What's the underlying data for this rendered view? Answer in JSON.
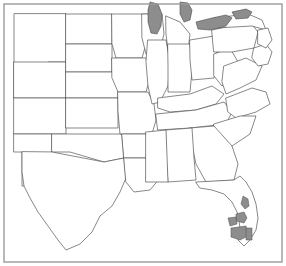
{
  "figure": {
    "width": 286,
    "height": 266,
    "background_color": "#ffffff",
    "frame": {
      "name": "map-border-frame",
      "color": "#9a9a9a",
      "style": "thin rectangular border",
      "x": 4,
      "y": 4,
      "width": 278,
      "height": 258
    }
  },
  "chart_data": {
    "type": "map",
    "title": "",
    "subtitle": "",
    "projection": "plate-carree-like",
    "region": "Central and Eastern United States",
    "line_color": "#555555",
    "fill_color": "#ffffff",
    "highlight_color": "#8d8d8d",
    "legend": null,
    "annotations": [],
    "visible_features": [
      "state boundary outlines",
      "national coastline",
      "shaded Great Lakes",
      "shaded counties in south Florida"
    ],
    "shaded_areas": [
      {
        "name": "Lake Michigan",
        "type": "lake",
        "color": "#8d8d8d"
      },
      {
        "name": "Lake Huron",
        "type": "lake",
        "color": "#8d8d8d"
      },
      {
        "name": "Lake Erie",
        "type": "lake",
        "color": "#8d8d8d"
      },
      {
        "name": "Lake Ontario",
        "type": "lake",
        "color": "#8d8d8d"
      },
      {
        "name": "South Florida counties",
        "type": "highlighted-region",
        "color": "#8d8d8d"
      }
    ],
    "states_depicted": [
      "Montana",
      "North Dakota",
      "South Dakota",
      "Wyoming",
      "Nebraska",
      "Colorado",
      "Kansas",
      "New Mexico",
      "Oklahoma",
      "Texas",
      "Minnesota",
      "Iowa",
      "Missouri",
      "Arkansas",
      "Louisiana",
      "Wisconsin",
      "Illinois",
      "Mississippi",
      "Alabama",
      "Tennessee",
      "Kentucky",
      "Indiana",
      "Michigan",
      "Ohio",
      "West Virginia",
      "Virginia",
      "North Carolina",
      "South Carolina",
      "Georgia",
      "Florida",
      "Pennsylvania",
      "Maryland",
      "Delaware",
      "New Jersey",
      "New York"
    ]
  },
  "map_geometry": {
    "outer_coastline": "M 30 14 L 256 14 L 258 24 L 268 36 L 272 48 L 268 58 L 270 70 L 262 84 L 252 96 L 248 110 L 240 124 L 232 140 L 225 152 L 215 162 L 200 168 L 185 172 L 170 175 L 155 178 L 140 180",
    "states": [
      {
        "id": "montana-wyoming-block",
        "name": "Montana / Wyoming",
        "d": "M 14 14 L 14 98 L 48 98 L 48 62 L 66 62 L 66 14 Z"
      },
      {
        "id": "wyoming",
        "name": "Wyoming",
        "d": "M 14 62 L 66 62 L 66 98 L 14 98 Z"
      },
      {
        "id": "colorado",
        "name": "Colorado",
        "d": "M 14 98 L 66 98 L 66 134 L 14 134 Z"
      },
      {
        "id": "new-mexico",
        "name": "New Mexico",
        "d": "M 14 134 L 52 134 L 52 186 L 22 186 L 22 152 L 14 152 Z"
      },
      {
        "id": "north-dakota",
        "name": "North Dakota",
        "d": "M 66 14 L 112 14 L 112 44 L 66 44 Z"
      },
      {
        "id": "south-dakota",
        "name": "South Dakota",
        "d": "M 66 44 L 112 44 L 112 72 L 66 72 Z"
      },
      {
        "id": "nebraska",
        "name": "Nebraska",
        "d": "M 66 72 L 118 72 L 118 98 L 66 98 Z"
      },
      {
        "id": "kansas",
        "name": "Kansas",
        "d": "M 66 98 L 118 98 L 118 128 L 66 128 Z"
      },
      {
        "id": "oklahoma",
        "name": "Oklahoma",
        "d": "M 52 134 L 122 134 L 124 158 L 104 162 L 70 152 L 52 152 Z"
      },
      {
        "id": "texas",
        "name": "Texas",
        "d": "M 52 152 L 104 162 L 124 158 L 126 178 L 120 192 L 112 206 L 100 216 L 92 232 L 80 244 L 66 250 L 58 240 L 48 226 L 38 212 L 30 198 L 24 186 L 22 172 L 22 152 Z"
      },
      {
        "id": "minnesota",
        "name": "Minnesota",
        "d": "M 112 14 L 148 14 L 150 30 L 146 44 L 142 58 L 116 58 L 112 44 Z"
      },
      {
        "id": "iowa",
        "name": "Iowa",
        "d": "M 112 58 L 146 58 L 150 78 L 146 92 L 118 92 L 112 78 Z"
      },
      {
        "id": "missouri",
        "name": "Missouri",
        "d": "M 118 92 L 148 92 L 154 104 L 156 120 L 152 134 L 120 134 L 118 112 Z"
      },
      {
        "id": "arkansas",
        "name": "Arkansas",
        "d": "M 122 134 L 154 134 L 156 158 L 124 158 Z"
      },
      {
        "id": "louisiana",
        "name": "Louisiana",
        "d": "M 124 158 L 156 158 L 160 178 L 150 190 L 134 192 L 126 182 Z"
      },
      {
        "id": "wisconsin",
        "name": "Wisconsin",
        "d": "M 142 14 L 162 14 L 164 34 L 160 50 L 146 54 L 142 38 Z"
      },
      {
        "id": "illinois",
        "name": "Illinois",
        "d": "M 148 40 L 166 40 L 170 62 L 168 86 L 160 102 L 152 104 L 148 86 L 146 62 Z"
      },
      {
        "id": "michigan-lower",
        "name": "Michigan",
        "d": "M 166 16 L 180 22 L 190 34 L 188 50 L 178 56 L 168 50 L 166 34 Z"
      },
      {
        "id": "indiana",
        "name": "Indiana",
        "d": "M 168 44 L 190 44 L 192 70 L 190 92 L 168 92 L 168 66 Z"
      },
      {
        "id": "ohio",
        "name": "Ohio",
        "d": "M 190 40 L 214 36 L 218 58 L 214 78 L 192 80 L 190 60 Z"
      },
      {
        "id": "kentucky",
        "name": "Kentucky",
        "d": "M 158 98 L 190 94 L 212 86 L 224 94 L 216 104 L 196 110 L 170 112 L 158 108 Z"
      },
      {
        "id": "tennessee",
        "name": "Tennessee",
        "d": "M 156 114 L 196 110 L 224 102 L 232 112 L 226 124 L 190 128 L 158 130 Z"
      },
      {
        "id": "west-virginia",
        "name": "West Virginia",
        "d": "M 214 54 L 230 48 L 238 62 L 232 78 L 222 86 L 214 76 Z"
      },
      {
        "id": "virginia",
        "name": "Virginia",
        "d": "M 224 66 L 246 58 L 262 66 L 256 80 L 240 88 L 226 94 L 222 82 Z"
      },
      {
        "id": "north-carolina",
        "name": "North Carolina",
        "d": "M 226 98 L 252 88 L 266 92 L 270 104 L 256 112 L 236 118 L 228 112 Z"
      },
      {
        "id": "south-carolina",
        "name": "South Carolina",
        "d": "M 214 124 L 240 116 L 256 116 L 250 134 L 232 146 L 214 140 Z"
      },
      {
        "id": "georgia",
        "name": "Georgia",
        "d": "M 190 128 L 214 126 L 232 146 L 238 164 L 234 180 L 206 182 L 196 164 L 192 146 Z"
      },
      {
        "id": "alabama",
        "name": "Alabama",
        "d": "M 166 130 L 192 128 L 194 158 L 196 180 L 168 182 L 166 156 Z"
      },
      {
        "id": "mississippi",
        "name": "Mississippi",
        "d": "M 146 132 L 166 130 L 168 182 L 146 182 Z"
      },
      {
        "id": "florida",
        "name": "Florida",
        "d": "M 196 182 L 234 180 L 240 176 L 246 182 L 252 192 L 256 204 L 258 218 L 256 230 L 250 240 L 244 246 L 238 240 L 240 228 L 238 214 L 232 202 L 224 194 L 212 190 L 200 188 Z"
      },
      {
        "id": "pennsylvania",
        "name": "Pennsylvania",
        "d": "M 212 30 L 250 22 L 258 32 L 254 48 L 232 52 L 214 52 Z"
      },
      {
        "id": "new-york",
        "name": "New York",
        "d": "M 214 18 L 248 14 L 262 20 L 266 30 L 252 26 L 216 28 Z"
      },
      {
        "id": "maryland-delaware",
        "name": "Maryland / Delaware",
        "d": "M 254 48 L 266 44 L 272 52 L 268 64 L 258 66 L 252 58 Z"
      },
      {
        "id": "new-jersey",
        "name": "New Jersey",
        "d": "M 258 30 L 268 28 L 272 40 L 266 48 L 258 44 Z"
      }
    ],
    "lakes": [
      {
        "id": "lake-michigan",
        "name": "Lake Michigan",
        "d": "M 150 2 L 158 4 L 162 14 L 161 26 L 157 34 L 151 33 L 148 22 L 148 10 Z"
      },
      {
        "id": "lake-huron",
        "name": "Lake Huron",
        "d": "M 180 2 L 188 3 L 192 10 L 190 20 L 184 22 L 180 14 Z"
      },
      {
        "id": "lake-erie",
        "name": "Lake Erie",
        "d": "M 196 22 L 212 18 L 226 15 L 232 18 L 226 26 L 210 30 L 198 29 Z"
      },
      {
        "id": "lake-ontario",
        "name": "Lake Ontario",
        "d": "M 232 12 L 246 9 L 252 12 L 248 18 L 236 19 Z"
      }
    ],
    "highlights": [
      {
        "id": "fl-highlight-1",
        "name": "south-florida-shaded-area-1",
        "d": "M 243 196 L 248 199 L 249 206 L 245 209 L 241 204 Z"
      },
      {
        "id": "fl-highlight-2",
        "name": "south-florida-shaded-area-2",
        "d": "M 236 214 L 244 212 L 247 218 L 244 223 L 236 221 Z"
      },
      {
        "id": "fl-highlight-3",
        "name": "south-florida-shaded-area-3",
        "d": "M 228 218 L 236 217 L 237 224 L 230 226 Z"
      },
      {
        "id": "fl-highlight-4",
        "name": "south-florida-shaded-area-4",
        "d": "M 231 228 L 246 226 L 248 236 L 240 240 L 231 237 Z"
      },
      {
        "id": "fl-highlight-5",
        "name": "south-florida-shaded-area-5",
        "d": "M 246 228 L 252 228 L 252 240 L 246 240 Z"
      }
    ]
  }
}
